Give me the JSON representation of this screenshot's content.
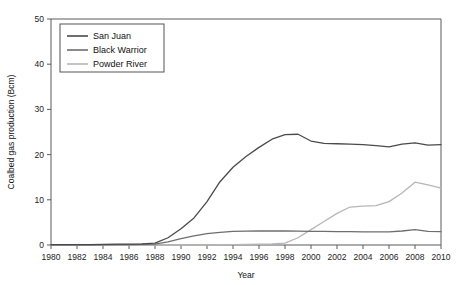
{
  "chart_data": {
    "type": "line",
    "title": "",
    "xlabel": "Year",
    "ylabel": "Coalbed gas production (Bcm)",
    "xlim": [
      1980,
      2010
    ],
    "ylim": [
      0,
      50
    ],
    "xticks": [
      1980,
      1982,
      1984,
      1986,
      1988,
      1990,
      1992,
      1994,
      1996,
      1998,
      2000,
      2002,
      2004,
      2006,
      2008,
      2010
    ],
    "yticks": [
      0,
      10,
      20,
      30,
      40,
      50
    ],
    "xticklabels": [
      "1980",
      "1982",
      "1984",
      "1986",
      "1988",
      "1990",
      "1992",
      "1994",
      "1996",
      "1998",
      "2000",
      "2002",
      "2004",
      "2006",
      "2008",
      "2010"
    ],
    "yticklabels": [
      "0",
      "10",
      "20",
      "30",
      "40",
      "50"
    ],
    "grid": false,
    "legend_position": "upper-left",
    "x": [
      1980,
      1981,
      1982,
      1983,
      1984,
      1985,
      1986,
      1987,
      1988,
      1989,
      1990,
      1991,
      1992,
      1993,
      1994,
      1995,
      1996,
      1997,
      1998,
      1999,
      2000,
      2001,
      2002,
      2003,
      2004,
      2005,
      2006,
      2007,
      2008,
      2009,
      2010
    ],
    "series": [
      {
        "name": "San Juan",
        "color": "#4a4a4a",
        "values": [
          0.1,
          0.1,
          0.1,
          0.1,
          0.15,
          0.2,
          0.2,
          0.25,
          0.4,
          1.6,
          3.6,
          6.0,
          9.6,
          14.0,
          17.2,
          19.6,
          21.6,
          23.4,
          24.4,
          24.5,
          23.0,
          22.5,
          22.4,
          22.3,
          22.2,
          22.0,
          21.7,
          22.3,
          22.6,
          22.1,
          22.2
        ]
      },
      {
        "name": "Black Warrior",
        "color": "#6e6e6e",
        "values": [
          0.05,
          0.05,
          0.05,
          0.05,
          0.05,
          0.08,
          0.1,
          0.12,
          0.2,
          0.7,
          1.4,
          2.0,
          2.5,
          2.8,
          3.0,
          3.05,
          3.1,
          3.1,
          3.1,
          3.05,
          3.0,
          3.0,
          2.95,
          2.95,
          2.9,
          2.9,
          2.9,
          3.1,
          3.4,
          3.0,
          2.95
        ]
      },
      {
        "name": "Powder River",
        "color": "#b6b6b6",
        "values": [
          0.0,
          0.0,
          0.0,
          0.0,
          0.0,
          0.0,
          0.0,
          0.0,
          0.0,
          0.0,
          0.0,
          0.0,
          0.0,
          0.05,
          0.1,
          0.15,
          0.2,
          0.25,
          0.4,
          1.6,
          3.4,
          5.2,
          7.0,
          8.4,
          8.6,
          8.7,
          9.6,
          11.5,
          13.9,
          13.3,
          12.6
        ]
      }
    ]
  },
  "legend": {
    "entries": [
      {
        "label": "San Juan"
      },
      {
        "label": "Black Warrior"
      },
      {
        "label": "Powder River"
      }
    ]
  }
}
